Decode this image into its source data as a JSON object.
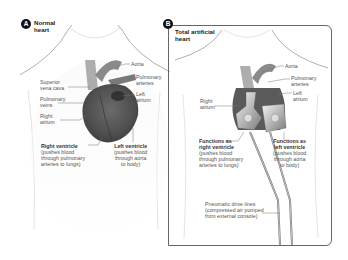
{
  "panels": [
    {
      "badge": "A",
      "title_line1": "Normal",
      "title_line2": "heart",
      "labels": {
        "aorta": "Aorta",
        "pulmonary_arteries_1": "Pulmonary",
        "pulmonary_arteries_2": "arteries",
        "left_atrium_1": "Left",
        "left_atrium_2": "atrium",
        "superior_vena_cava_1": "Superior",
        "superior_vena_cava_2": "vena cava",
        "pulmonary_veins_1": "Pulmonary",
        "pulmonary_veins_2": "veins",
        "right_atrium_1": "Right",
        "right_atrium_2": "atrium",
        "right_ventricle_title": "Right ventricle",
        "right_ventricle_desc_1": "(pushes blood",
        "right_ventricle_desc_2": "through pulmonary",
        "right_ventricle_desc_3": "arteries to lungs)",
        "left_ventricle_title": "Left ventricle",
        "left_ventricle_desc_1": "(pushes blood",
        "left_ventricle_desc_2": "through aorta",
        "left_ventricle_desc_3": "to body)"
      }
    },
    {
      "badge": "B",
      "title_line1": "Total artificial",
      "title_line2": "heart",
      "labels": {
        "aorta": "Aorta",
        "pulmonary_arteries_1": "Pulmonary",
        "pulmonary_arteries_2": "arteries",
        "left_atrium_1": "Left",
        "left_atrium_2": "atrium",
        "right_atrium_1": "Right",
        "right_atrium_2": "atrium",
        "rv_title_1": "Functions as",
        "rv_title_2": "right ventricle",
        "rv_desc_1": "(pushes blood",
        "rv_desc_2": "through pulmonary",
        "rv_desc_3": "arteries to lungs)",
        "lv_title_1": "Functions as",
        "lv_title_2": "left ventricle",
        "lv_desc_1": "(pushes blood",
        "lv_desc_2": "through aorta",
        "lv_desc_3": "to body)",
        "drive_lines_1": "Pneumatic drive lines",
        "drive_lines_2": "(compressed air pumped",
        "drive_lines_3": "from external console)"
      }
    }
  ],
  "colors": {
    "badge": "#111111",
    "heart": "#5a5a5a",
    "body_outline": "#9a9a9a",
    "panel_border": "#666666"
  }
}
